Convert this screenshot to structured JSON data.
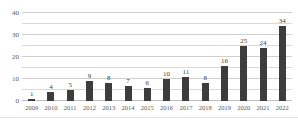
{
  "chart_data": {
    "type": "bar",
    "title": "",
    "subtitle": "",
    "xlabel": "",
    "ylabel": "",
    "categories": [
      "2009",
      "2010",
      "2011",
      "2012",
      "2013",
      "2014",
      "2015",
      "2016",
      "2017",
      "2018",
      "2019",
      "2020",
      "2021",
      "2022"
    ],
    "values": [
      1,
      4,
      5,
      9,
      8,
      7,
      6,
      10,
      11,
      8,
      16,
      25,
      24,
      34
    ],
    "data_labels": [
      "1",
      "4",
      "5",
      "9",
      "8",
      "7",
      "6",
      "10",
      "11",
      "8",
      "16",
      "25",
      "24",
      "34"
    ],
    "ylim": [
      0,
      40
    ],
    "ytick_labels": [
      "0",
      "10",
      "20",
      "30",
      "40"
    ],
    "ytick_values": [
      0,
      10,
      20,
      30,
      40
    ],
    "gridline_values": [
      5,
      10,
      15,
      20,
      25,
      30,
      35,
      40
    ],
    "grid": true,
    "legend": "none",
    "series": [
      {
        "name": "count",
        "values": [
          1,
          4,
          5,
          9,
          8,
          7,
          6,
          10,
          11,
          8,
          16,
          25,
          24,
          34
        ]
      }
    ],
    "colors": {
      "bar": "#3d3d3d",
      "grid": "#d9d9d9",
      "axis": "#bfbfbf",
      "tick_text": "#59595c",
      "label_text": "#404040",
      "background": "#ffffff"
    }
  }
}
